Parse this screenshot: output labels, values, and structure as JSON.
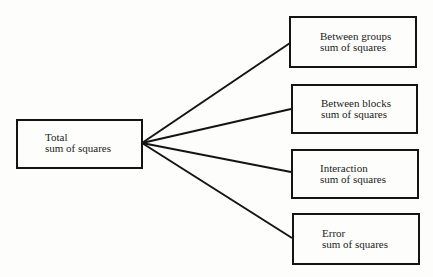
{
  "diagram": {
    "type": "partition-tree",
    "root": {
      "id": "total",
      "line1": "Total",
      "line2": "sum of squares"
    },
    "components": [
      {
        "id": "between-groups",
        "line1": "Between groups",
        "line2": "sum of squares"
      },
      {
        "id": "between-blocks",
        "line1": "Between blocks",
        "line2": "sum of squares"
      },
      {
        "id": "interaction",
        "line1": "Interaction",
        "line2": "sum of squares"
      },
      {
        "id": "error",
        "line1": "Error",
        "line2": "sum of squares"
      }
    ],
    "edges": [
      {
        "from": "total",
        "to": "between-groups"
      },
      {
        "from": "total",
        "to": "between-blocks"
      },
      {
        "from": "total",
        "to": "interaction"
      },
      {
        "from": "total",
        "to": "error"
      }
    ],
    "colors": {
      "line": "#141414",
      "background": "#fdfdfc",
      "text": "#222222"
    }
  }
}
